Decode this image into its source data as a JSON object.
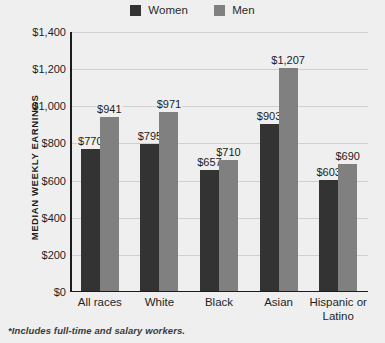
{
  "chart_data": {
    "type": "bar",
    "title": "",
    "xlabel": "",
    "ylabel": "MEDIAN WEEKLY EARNINGS",
    "categories": [
      "All races",
      "White",
      "Black",
      "Asian",
      "Hispanic or Latino"
    ],
    "series": [
      {
        "name": "Women",
        "color": "#333333",
        "values": [
          770,
          795,
          657,
          903,
          603
        ]
      },
      {
        "name": "Men",
        "color": "#808080",
        "values": [
          941,
          971,
          710,
          1207,
          690
        ]
      }
    ],
    "value_labels": [
      [
        "$770",
        "$941"
      ],
      [
        "$795",
        "$971"
      ],
      [
        "$657",
        "$710"
      ],
      [
        "$903",
        "$1,207"
      ],
      [
        "$603",
        "$690"
      ]
    ],
    "ylim": [
      0,
      1400
    ],
    "ytick_values": [
      0,
      200,
      400,
      600,
      800,
      1000,
      1200,
      1400
    ],
    "ytick_labels": [
      "$0",
      "$200",
      "$400",
      "$600",
      "$800",
      "$1,000",
      "$1,200",
      "$1,400"
    ],
    "grid": true,
    "legend_position": "top-center"
  },
  "legend": {
    "items": [
      {
        "label": "Women",
        "color": "#333333"
      },
      {
        "label": "Men",
        "color": "#808080"
      }
    ]
  },
  "footnote": "*Includes full-time and salary workers.",
  "colors": {
    "background": "#efefef",
    "axis": "#1c1c1c",
    "gridline": "#cfcfcf",
    "women": "#333333",
    "men": "#808080"
  }
}
